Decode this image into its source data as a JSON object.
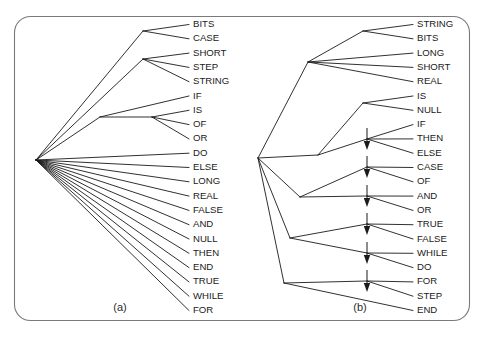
{
  "figure": {
    "width": 484,
    "height": 338,
    "frame": {
      "x": 14,
      "y": 16,
      "width": 455,
      "height": 305,
      "radius": 16,
      "stroke": "#7a7a7a"
    },
    "line_color": "#1a1a1a",
    "background": "#ffffff"
  },
  "panels": [
    {
      "id": "panel-a",
      "caption": "(a)",
      "caption_x": 120,
      "caption_y": 311,
      "root": {
        "x": 36,
        "y": 160
      },
      "label_x": 193,
      "leaf_tick_x": 189,
      "first_leaf_y": 24.5,
      "leaf_spacing": 14.3,
      "leaves": [
        "BITS",
        "CASE",
        "SHORT",
        "STEP",
        "STRING",
        "IF",
        "IS",
        "OF",
        "OR",
        "DO",
        "ELSE",
        "LONG",
        "REAL",
        "FALSE",
        "AND",
        "NULL",
        "THEN",
        "END",
        "TRUE",
        "WHILE",
        "FOR"
      ],
      "internal_nodes": [
        {
          "id": "n-bits-case",
          "x": 143,
          "y": 31,
          "children": [
            0,
            1
          ]
        },
        {
          "id": "n-short-step-string",
          "x": 143,
          "y": 59,
          "children": [
            2,
            3,
            4
          ]
        },
        {
          "id": "n-if-isofor",
          "x": 100,
          "y": 117,
          "children_direct": [
            5
          ],
          "child_nodes": [
            "n-is-of-or"
          ]
        },
        {
          "id": "n-is-of-or",
          "x": 152,
          "y": 117,
          "children": [
            6,
            7,
            8
          ]
        }
      ],
      "direct_leaves": [
        9,
        10,
        11,
        12,
        13,
        14,
        15,
        16,
        17,
        18,
        19,
        20
      ],
      "root_children_nodes": [
        "n-bits-case",
        "n-short-step-string",
        "n-if-isofor"
      ]
    },
    {
      "id": "panel-b",
      "caption": "(b)",
      "caption_x": 360,
      "caption_y": 311,
      "root": {
        "x": 258,
        "y": 158
      },
      "label_x": 417,
      "leaf_tick_x": 413,
      "first_leaf_y": 24.5,
      "leaf_spacing": 14.3,
      "leaves": [
        "STRING",
        "BITS",
        "LONG",
        "SHORT",
        "REAL",
        "IS",
        "NULL",
        "IF",
        "THEN",
        "ELSE",
        "CASE",
        "OF",
        "AND",
        "OR",
        "TRUE",
        "FALSE",
        "WHILE",
        "DO",
        "FOR",
        "STEP",
        "END"
      ],
      "chain_x": 367,
      "internal_nodes": [
        {
          "id": "b-string-bits",
          "x": 363,
          "y": 31,
          "children": [
            0,
            1
          ]
        },
        {
          "id": "b-type-group",
          "x": 308,
          "y": 62,
          "children": [
            2,
            3,
            4
          ]
        },
        {
          "id": "b-is-null",
          "x": 363,
          "y": 103,
          "children": [
            5,
            6
          ]
        },
        {
          "id": "b-chain-1",
          "x": 367,
          "y": 139,
          "children": [
            7,
            8,
            9
          ]
        },
        {
          "id": "b-chain-2",
          "x": 367,
          "y": 167,
          "children": [
            10,
            11
          ]
        },
        {
          "id": "b-chain-3",
          "x": 367,
          "y": 196,
          "children": [
            12,
            13
          ]
        },
        {
          "id": "b-chain-4",
          "x": 367,
          "y": 224,
          "children": [
            14,
            15
          ]
        },
        {
          "id": "b-chain-5",
          "x": 367,
          "y": 253,
          "children": [
            16,
            17
          ]
        },
        {
          "id": "b-chain-6",
          "x": 367,
          "y": 281,
          "children": [
            18,
            19
          ]
        },
        {
          "id": "b-mid-left",
          "x": 318,
          "y": 155,
          "children": []
        },
        {
          "id": "b-lower-left",
          "x": 300,
          "y": 197,
          "children": []
        },
        {
          "id": "b-bottom-left",
          "x": 290,
          "y": 238,
          "children": []
        },
        {
          "id": "b-bottom-bend",
          "x": 284,
          "y": 283,
          "children": [
            20
          ]
        }
      ],
      "arrow_chain_targets": [
        139,
        167,
        196,
        224,
        253,
        281
      ]
    }
  ]
}
